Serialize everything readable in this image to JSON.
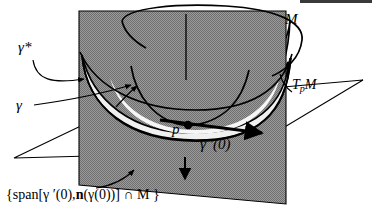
{
  "figure": {
    "domain_note": "differential-geometry diagram",
    "background_color": "#ffffff",
    "stroke_color": "#000000"
  },
  "colors": {
    "cutting_plane_fill": "#8d8d8d",
    "cutting_plane_fill_dark": "#808080",
    "bowl_outer_fill": "#9a9a9a",
    "bowl_inner_fill": "#f2f2f2",
    "tangent_plane_fill": "#ffffff",
    "stroke": "#000000"
  },
  "labels": {
    "gamma_star": "γ*",
    "gamma": "γ",
    "manifold": "M",
    "tangent_space_T": "T",
    "tangent_space_sub": "p",
    "tangent_space_M": "M",
    "point": "p",
    "gamma_prime": "γ ′(0)",
    "caption_open": "{span[γ ′(0),",
    "caption_normal": "n",
    "caption_mid": "(γ(0))] ∩ ",
    "caption_M": "M",
    "caption_close": " }",
    "caption_full": "{span[γ ′(0),n(γ(0))] ∩ M }"
  },
  "elements": {
    "cutting_plane": "vertical-grey-plane",
    "bowl_surface": "paraboloid-bowl-M",
    "tangent_plane": "horizontal-tangent-plane-TpM",
    "point_marker": "point-p-dot",
    "tangent_vector_arrow": "gamma-prime-0-arrow",
    "normal_arrow": "downward-normal-arrow",
    "leader_gamma_star": "leader-arrow-gamma-star",
    "leader_gamma": "leader-arrow-gamma",
    "leader_caption": "leader-arrow-caption",
    "top_rim": "bowl-top-rim-ellipse",
    "plane_seam": "cutting-plane-vertical-seam"
  }
}
